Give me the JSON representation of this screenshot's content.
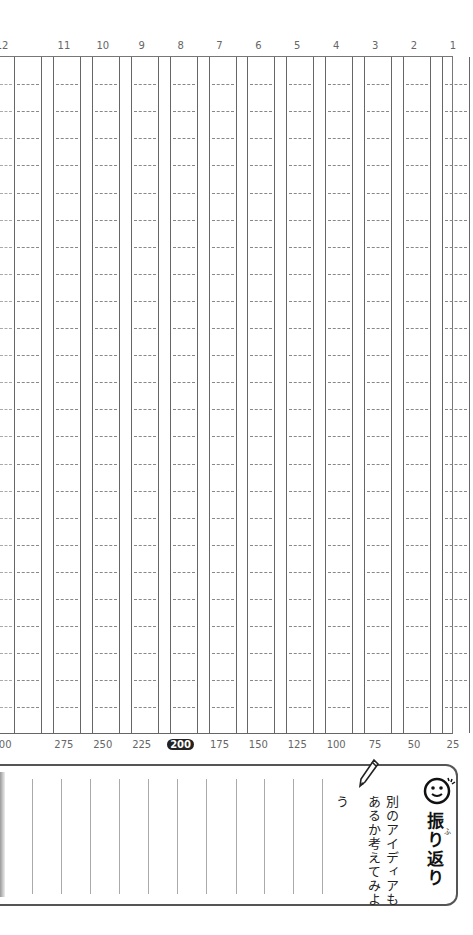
{
  "top_numbers": [
    "12",
    "11",
    "10",
    "9",
    "8",
    "7",
    "6",
    "5",
    "4",
    "3",
    "2",
    "1"
  ],
  "bottom_numbers": [
    "300",
    "275",
    "250",
    "225",
    "200",
    "175",
    "150",
    "125",
    "100",
    "75",
    "50",
    "25"
  ],
  "highlighted_bottom": "200",
  "grid": {
    "columns": 12,
    "rows": 25
  },
  "reflection": {
    "title": "振り返り",
    "ruby": "ふ",
    "prompt_line1": "別のアイディアも",
    "prompt_line2": "あるか考えてみよ",
    "prompt_line3": "う",
    "icons": [
      "smiley-icon",
      "pencil-icon"
    ]
  }
}
